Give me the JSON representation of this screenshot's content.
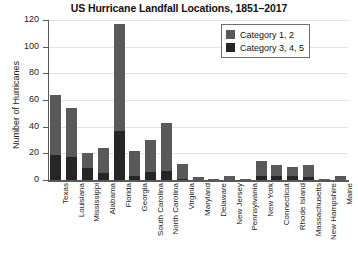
{
  "chart_data": {
    "type": "bar",
    "title": "US Hurricane Landfall Locations, 1851–2017",
    "xlabel": "",
    "ylabel": "Number of Hurricanes",
    "ylim": [
      0,
      120
    ],
    "yticks": [
      0,
      20,
      40,
      60,
      80,
      100,
      120
    ],
    "ytick_labels": [
      "0",
      "20",
      "40",
      "60",
      "80",
      "100",
      "120"
    ],
    "grid": true,
    "stacked": true,
    "legend_position": "upper right",
    "categories": [
      "Texas",
      "Louisiana",
      "Mississippi",
      "Alabama",
      "Florida",
      "Georgia",
      "South Carolina",
      "North Carolina",
      "Virginia",
      "Maryland",
      "Delaware",
      "New Jersey",
      "Pennsylvania",
      "New York",
      "Connecticut",
      "Rhode Island",
      "Massachusetts",
      "New Hampshire",
      "Maine"
    ],
    "series": [
      {
        "name": "Category 3, 4, 5",
        "color": "#262626",
        "values": [
          19,
          17,
          9,
          5,
          37,
          3,
          6,
          7,
          1,
          0,
          0,
          0,
          0,
          3,
          3,
          3,
          2,
          0,
          0
        ]
      },
      {
        "name": "Category 1, 2",
        "color": "#595959",
        "values": [
          45,
          37,
          11,
          19,
          80,
          19,
          24,
          36,
          11,
          2,
          1,
          3,
          1,
          11,
          8,
          7,
          9,
          1,
          3
        ]
      }
    ],
    "totals": [
      64,
      54,
      20,
      24,
      117,
      22,
      30,
      43,
      12,
      2,
      1,
      3,
      1,
      14,
      11,
      10,
      11,
      1,
      3
    ]
  },
  "legend": {
    "items": [
      {
        "label": "Category 1, 2",
        "color": "#595959"
      },
      {
        "label": "Category 3, 4, 5",
        "color": "#262626"
      }
    ]
  },
  "colors": {
    "category_12": "#595959",
    "category_345": "#262626",
    "axis": "#58595b",
    "gridline": "#e2e2e2",
    "background": "#ffffff"
  }
}
